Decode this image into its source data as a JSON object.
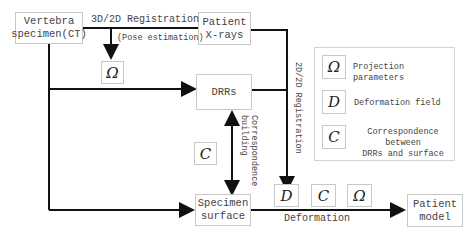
{
  "nodes": {
    "vertebra": "Vertebra\nspecimen(CT)",
    "xrays": "Patient\nX-rays",
    "drrs": "DRRs",
    "surface": "Specimen\nsurface",
    "model": "Patient\nmodel"
  },
  "edges": {
    "reg3d2d": "3D/2D Registration",
    "pose": "(Pose estimation)",
    "reg2d2d": "2D/2D Registration",
    "correspondence": "Correspondence\nbuilding",
    "deformation": "Deformation"
  },
  "symbols": {
    "omega": "Ω",
    "deformation": "D",
    "correspondence": "C"
  },
  "legend": [
    {
      "symbol": "Ω",
      "text": "Projection parameters"
    },
    {
      "symbol": "D",
      "text": "Deformation field"
    },
    {
      "symbol": "C",
      "text": "Correspondence between\nDRRs and surface"
    }
  ]
}
